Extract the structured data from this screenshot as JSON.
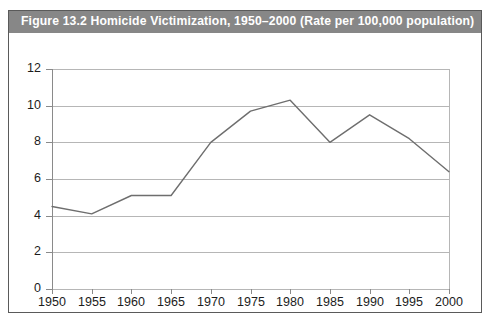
{
  "figure": {
    "title": "Figure 13.2   Homicide Victimization, 1950–2000 (Rate per 100,000 population)",
    "title_bar_color": "#878787",
    "title_text_color": "#ffffff",
    "frame_border_color": "#5a5a5a",
    "background_color": "#ffffff"
  },
  "chart_data": {
    "type": "line",
    "title": "Figure 13.2   Homicide Victimization, 1950–2000 (Rate per 100,000 population)",
    "xlabel": "",
    "ylabel": "",
    "x": [
      1950,
      1955,
      1960,
      1965,
      1970,
      1975,
      1980,
      1985,
      1990,
      1995,
      2000
    ],
    "xtick_labels": [
      "1950",
      "1955",
      "1960",
      "1965",
      "1970",
      "1975",
      "1980",
      "1985",
      "1990",
      "1995",
      "2000"
    ],
    "values": [
      4.5,
      4.1,
      5.1,
      5.1,
      8.0,
      9.7,
      10.3,
      8.0,
      9.5,
      8.2,
      6.4
    ],
    "series": [
      {
        "name": "Homicide victimization rate",
        "values": [
          4.5,
          4.1,
          5.1,
          5.1,
          8.0,
          9.7,
          10.3,
          8.0,
          9.5,
          8.2,
          6.4
        ],
        "color": "#6e6e6e"
      }
    ],
    "ylim": [
      0,
      12
    ],
    "xlim": [
      1950,
      2000
    ],
    "ytick_values": [
      0,
      2,
      4,
      6,
      8,
      10,
      12
    ],
    "ytick_labels": [
      "0",
      "2",
      "4",
      "6",
      "8",
      "10",
      "12"
    ],
    "grid": true,
    "grid_axis": "y",
    "grid_color": "#b6b6b6",
    "legend": false,
    "legend_position": "none",
    "markers": false,
    "line_color": "#6e6e6e",
    "line_width": 1.4
  }
}
